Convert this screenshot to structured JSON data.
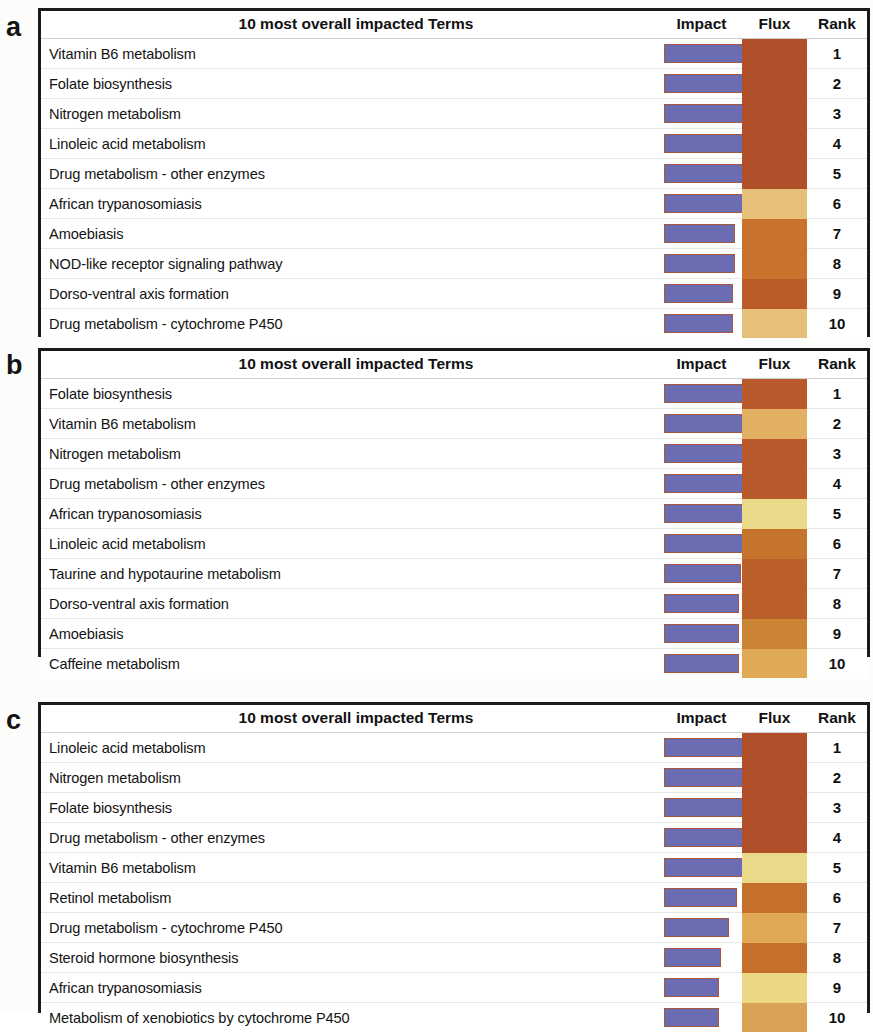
{
  "figure": {
    "columns": [
      "10 most overall impacted Terms",
      "Impact",
      "Flux",
      "Rank"
    ],
    "colors": {
      "impact_fill": "#6c6cb2",
      "impact_border": "#a8563c",
      "flux_dark_red": "#b0502a",
      "flux_orange": "#c06a2c",
      "flux_tan": "#dfa955",
      "flux_light_tan": "#e6c079",
      "flux_pale_yellow": "#ebd98a",
      "panel_border": "#1b1b1b"
    }
  },
  "panels": [
    {
      "letter": "a",
      "header": {
        "terms": "10 most overall impacted Terms",
        "impact": "Impact",
        "flux": "Flux",
        "rank": "Rank"
      },
      "rows": [
        {
          "term": "Vitamin B6 metabolism",
          "rank": "1",
          "impact": 100,
          "flux": "#b0502a"
        },
        {
          "term": "Folate biosynthesis",
          "rank": "2",
          "impact": 100,
          "flux": "#b0502a"
        },
        {
          "term": "Nitrogen metabolism",
          "rank": "3",
          "impact": 100,
          "flux": "#b0502a"
        },
        {
          "term": "Linoleic acid metabolism",
          "rank": "4",
          "impact": 100,
          "flux": "#b0502a"
        },
        {
          "term": "Drug metabolism - other enzymes",
          "rank": "5",
          "impact": 100,
          "flux": "#b0502a"
        },
        {
          "term": "African trypanosomiasis",
          "rank": "6",
          "impact": 100,
          "flux": "#e6c079"
        },
        {
          "term": "Amoebiasis",
          "rank": "7",
          "impact": 88,
          "flux": "#c8722e"
        },
        {
          "term": "NOD-like receptor signaling pathway",
          "rank": "8",
          "impact": 88,
          "flux": "#c8722e"
        },
        {
          "term": "Dorso-ventral axis formation",
          "rank": "9",
          "impact": 85,
          "flux": "#bb5c28"
        },
        {
          "term": "Drug metabolism - cytochrome P450",
          "rank": "10",
          "impact": 85,
          "flux": "#e6c079"
        }
      ]
    },
    {
      "letter": "b",
      "header": {
        "terms": "10 most overall impacted Terms",
        "impact": "Impact",
        "flux": "Flux",
        "rank": "Rank"
      },
      "rows": [
        {
          "term": "Folate biosynthesis",
          "rank": "1",
          "impact": 100,
          "flux": "#b85a2c"
        },
        {
          "term": "Vitamin B6 metabolism",
          "rank": "2",
          "impact": 100,
          "flux": "#e2b063"
        },
        {
          "term": "Nitrogen metabolism",
          "rank": "3",
          "impact": 100,
          "flux": "#b85a2c"
        },
        {
          "term": "Drug metabolism - other enzymes",
          "rank": "4",
          "impact": 100,
          "flux": "#b85a2c"
        },
        {
          "term": "African trypanosomiasis",
          "rank": "5",
          "impact": 100,
          "flux": "#ebd98a"
        },
        {
          "term": "Linoleic acid metabolism",
          "rank": "6",
          "impact": 100,
          "flux": "#c4742c"
        },
        {
          "term": "Taurine and hypotaurine metabolism",
          "rank": "7",
          "impact": 95,
          "flux": "#bb5f2a"
        },
        {
          "term": "Dorso-ventral axis formation",
          "rank": "8",
          "impact": 92,
          "flux": "#bb5f2a"
        },
        {
          "term": "Amoebiasis",
          "rank": "9",
          "impact": 92,
          "flux": "#cb8334"
        },
        {
          "term": "Caffeine metabolism",
          "rank": "10",
          "impact": 92,
          "flux": "#dfa955"
        }
      ]
    },
    {
      "letter": "c",
      "header": {
        "terms": "10 most overall impacted Terms",
        "impact": "Impact",
        "flux": "Flux",
        "rank": "Rank"
      },
      "rows": [
        {
          "term": "Linoleic acid metabolism",
          "rank": "1",
          "impact": 100,
          "flux": "#b0502a"
        },
        {
          "term": "Nitrogen metabolism",
          "rank": "2",
          "impact": 100,
          "flux": "#b0502a"
        },
        {
          "term": "Folate biosynthesis",
          "rank": "3",
          "impact": 100,
          "flux": "#b0502a"
        },
        {
          "term": "Drug metabolism - other enzymes",
          "rank": "4",
          "impact": 100,
          "flux": "#b0502a"
        },
        {
          "term": "Vitamin B6 metabolism",
          "rank": "5",
          "impact": 98,
          "flux": "#ebd98a"
        },
        {
          "term": "Retinol metabolism",
          "rank": "6",
          "impact": 90,
          "flux": "#c4702c"
        },
        {
          "term": "Drug metabolism - cytochrome P450",
          "rank": "7",
          "impact": 80,
          "flux": "#dfa955"
        },
        {
          "term": "Steroid hormone biosynthesis",
          "rank": "8",
          "impact": 70,
          "flux": "#c4702c"
        },
        {
          "term": "African trypanosomiasis",
          "rank": "9",
          "impact": 68,
          "flux": "#ecd884"
        },
        {
          "term": "Metabolism of xenobiotics by cytochrome P450",
          "rank": "10",
          "impact": 68,
          "flux": "#daa257"
        }
      ]
    }
  ]
}
